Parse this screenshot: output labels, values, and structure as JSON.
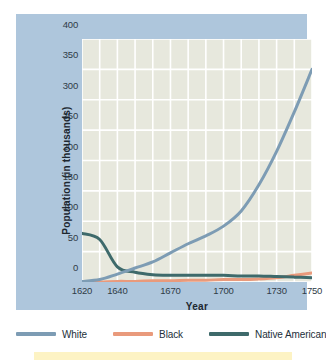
{
  "chart_data": {
    "type": "line",
    "title": "",
    "xlabel": "Year",
    "ylabel": "Population (in thousands)",
    "xlim": [
      1620,
      1750
    ],
    "ylim": [
      0,
      400
    ],
    "grid": true,
    "legend_position": "bottom",
    "x_ticks": [
      1620,
      1640,
      1670,
      1700,
      1730,
      1750
    ],
    "x_tick_labels": [
      "1620",
      "1640",
      "1670",
      "1700",
      "1730",
      "1750"
    ],
    "y_ticks": [
      0,
      50,
      100,
      150,
      200,
      250,
      300,
      350,
      400
    ],
    "y_tick_labels": [
      "0",
      "50",
      "100",
      "150",
      "200",
      "250",
      "300",
      "350",
      "400"
    ],
    "x_gridlines": [
      1620,
      1630,
      1640,
      1650,
      1660,
      1670,
      1680,
      1690,
      1700,
      1710,
      1720,
      1730,
      1740,
      1750
    ],
    "x": [
      1620,
      1630,
      1640,
      1650,
      1660,
      1670,
      1680,
      1690,
      1700,
      1710,
      1720,
      1730,
      1740,
      1750
    ],
    "series": [
      {
        "name": "White",
        "color": "#7d9cb4",
        "values": [
          1,
          4,
          13,
          23,
          33,
          48,
          63,
          76,
          92,
          117,
          160,
          215,
          280,
          350
        ]
      },
      {
        "name": "Black",
        "color": "#e99a7c",
        "values": [
          0,
          0,
          1,
          1,
          2,
          2,
          3,
          3,
          4,
          4,
          5,
          7,
          11,
          15
        ]
      },
      {
        "name": "Native American",
        "color": "#3e6a6b",
        "values": [
          80,
          70,
          25,
          16,
          12,
          11,
          11,
          11,
          11,
          10,
          10,
          9,
          8,
          7
        ]
      }
    ]
  },
  "legend": {
    "items": [
      {
        "label": "White",
        "color": "#7d9cb4"
      },
      {
        "label": "Black",
        "color": "#e99a7c"
      },
      {
        "label": "Native American",
        "color": "#3e6a6b"
      }
    ]
  },
  "colors": {
    "panel_background": "#aec6dc",
    "plot_background": "#e7e8dd",
    "gridline": "#ffffff",
    "axis_text": "#2f3b47",
    "title_text": "#1d2730",
    "page_background": "#ffffff",
    "bottom_strip": "#fdf3c4"
  }
}
